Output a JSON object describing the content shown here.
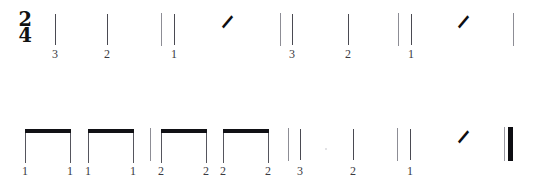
{
  "document": {
    "kind": "rhythm-notation-exercise",
    "time_signature": {
      "numerator": "2",
      "denominator": "4"
    },
    "background_color": "#ffffff",
    "ink_color": "#1a1a1a",
    "beam_color": "#111115",
    "stem_color": "#4a4a52",
    "barline_color": "#8d8d95",
    "count_color": "#3a3a42"
  },
  "systems": [
    {
      "name": "system-1",
      "y": 4,
      "elements": [
        {
          "type": "timesig",
          "name": "time-signature",
          "x": 18,
          "y": 6,
          "numerator": "2",
          "denominator": "4"
        },
        {
          "type": "stem",
          "name": "quarter-note-stem",
          "x": 55,
          "y": 10,
          "height": 31
        },
        {
          "type": "count",
          "name": "beat-count",
          "x": 55,
          "y": 44,
          "label": "3"
        },
        {
          "type": "stem",
          "name": "quarter-note-stem",
          "x": 107,
          "y": 10,
          "height": 31
        },
        {
          "type": "count",
          "name": "beat-count",
          "x": 107,
          "y": 44,
          "label": "2"
        },
        {
          "type": "barline",
          "name": "barline",
          "x": 161,
          "y": 9,
          "height": 33
        },
        {
          "type": "stem",
          "name": "quarter-note-stem",
          "x": 174,
          "y": 10,
          "height": 31
        },
        {
          "type": "count",
          "name": "beat-count",
          "x": 174,
          "y": 44,
          "label": "1"
        },
        {
          "type": "rest",
          "name": "quarter-rest",
          "x": 221,
          "y": 8,
          "glyph": "⸍"
        },
        {
          "type": "barline",
          "name": "barline",
          "x": 280,
          "y": 9,
          "height": 33
        },
        {
          "type": "stem",
          "name": "quarter-note-stem",
          "x": 292,
          "y": 10,
          "height": 31
        },
        {
          "type": "count",
          "name": "beat-count",
          "x": 292,
          "y": 44,
          "label": "3"
        },
        {
          "type": "stem",
          "name": "quarter-note-stem",
          "x": 348,
          "y": 10,
          "height": 31
        },
        {
          "type": "count",
          "name": "beat-count",
          "x": 348,
          "y": 44,
          "label": "2"
        },
        {
          "type": "barline",
          "name": "barline",
          "x": 398,
          "y": 9,
          "height": 33
        },
        {
          "type": "stem",
          "name": "quarter-note-stem",
          "x": 411,
          "y": 10,
          "height": 31
        },
        {
          "type": "count",
          "name": "beat-count",
          "x": 411,
          "y": 44,
          "label": "1"
        },
        {
          "type": "rest",
          "name": "quarter-rest",
          "x": 457,
          "y": 8,
          "glyph": "⸍"
        },
        {
          "type": "barline",
          "name": "barline",
          "x": 513,
          "y": 9,
          "height": 33
        }
      ]
    },
    {
      "name": "system-2",
      "y": 118,
      "elements": [
        {
          "type": "beamgroup",
          "name": "eighth-note-beam-group",
          "x": 25,
          "y": 11,
          "width": 46,
          "stem_height": 30,
          "counts": [
            "1",
            "1"
          ],
          "count_y": 47
        },
        {
          "type": "beamgroup",
          "name": "eighth-note-beam-group",
          "x": 88,
          "y": 11,
          "width": 46,
          "stem_height": 30,
          "counts": [
            "1",
            "1"
          ],
          "count_y": 47
        },
        {
          "type": "barline",
          "name": "barline",
          "x": 150,
          "y": 10,
          "height": 33
        },
        {
          "type": "beamgroup",
          "name": "eighth-note-beam-group",
          "x": 161,
          "y": 11,
          "width": 46,
          "stem_height": 30,
          "counts": [
            "2",
            "2"
          ],
          "count_y": 47
        },
        {
          "type": "beamgroup",
          "name": "eighth-note-beam-group",
          "x": 223,
          "y": 11,
          "width": 46,
          "stem_height": 30,
          "counts": [
            "2",
            "2"
          ],
          "count_y": 47
        },
        {
          "type": "barline",
          "name": "barline",
          "x": 288,
          "y": 10,
          "height": 33
        },
        {
          "type": "stem",
          "name": "quarter-note-stem",
          "x": 300,
          "y": 11,
          "height": 31
        },
        {
          "type": "count",
          "name": "beat-count",
          "x": 300,
          "y": 47,
          "label": "3"
        },
        {
          "type": "speck",
          "name": "scan-speck",
          "x": 325,
          "y": 30
        },
        {
          "type": "stem",
          "name": "quarter-note-stem",
          "x": 353,
          "y": 11,
          "height": 31
        },
        {
          "type": "count",
          "name": "beat-count",
          "x": 353,
          "y": 47,
          "label": "2"
        },
        {
          "type": "barline",
          "name": "barline",
          "x": 397,
          "y": 10,
          "height": 33
        },
        {
          "type": "stem",
          "name": "quarter-note-stem",
          "x": 410,
          "y": 11,
          "height": 31
        },
        {
          "type": "count",
          "name": "beat-count",
          "x": 410,
          "y": 47,
          "label": "1"
        },
        {
          "type": "rest",
          "name": "quarter-rest",
          "x": 457,
          "y": 9,
          "glyph": "⸍"
        },
        {
          "type": "finalbar",
          "name": "final-barline",
          "x": 504,
          "y": 9,
          "height": 34
        }
      ]
    }
  ]
}
